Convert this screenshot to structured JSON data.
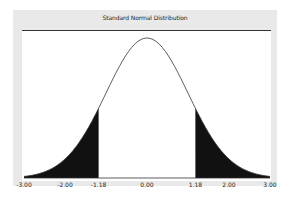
{
  "chart_data": {
    "type": "area",
    "title": "Standard Normal Distribution",
    "xlabel": "",
    "ylabel": "",
    "xlim": [
      -3.0,
      3.0
    ],
    "distribution": "standard normal",
    "mean": 0.0,
    "std": 1.0,
    "shaded_regions": [
      {
        "from": -3.0,
        "to": -1.18,
        "fill": "#111111"
      },
      {
        "from": 1.18,
        "to": 3.0,
        "fill": "#111111"
      }
    ],
    "x_ticks": [
      "-3.00",
      "-2.00",
      "-1.18",
      "0.00",
      "1.18",
      "2.00",
      "3.00"
    ],
    "tick_values": [
      -3.0,
      -2.0,
      -1.18,
      0.0,
      1.18,
      2.0,
      3.0
    ],
    "grid": false,
    "legend": "none"
  },
  "colors": {
    "frame_bg": "#e9e9e9",
    "plot_bg": "#ffffff",
    "curve": "#333333",
    "shade": "#111111"
  }
}
